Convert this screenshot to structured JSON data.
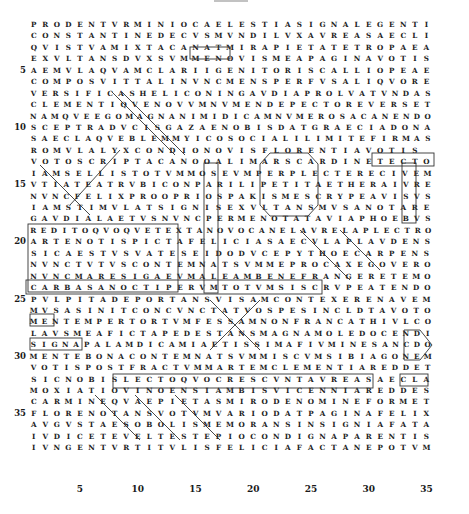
{
  "page": {
    "type": "carmen cancellatum (Latin grid poem)"
  },
  "grid": {
    "rows": [
      "PRODENTVRMINIOCAELESTIASIGNALEGENTI",
      "CONSTANTINEDECVSMVNDILVXAVREASAECLI",
      "QVISTVAMIXTACANATMIRAPIETATETROPAEA",
      "EXVLTANSDVXSVMMENOVISMEAPAGINAVOTIS",
      "AEMVLAQVAMCLARIIGENITORISCALLIOPEAE",
      "COMPOSVITTALINVNCMENSPERFVSALIQVORE",
      "VERSIFICASHELICONINGAVDIAPROLVATVNDAS",
      "CLEMENTIQVENOVVMNVMENDEPECTOREVERSET",
      "NAMQVEEGOMAGNANIMIDICAMNVMEROSACANENDO",
      "SCEPTRADVCISGAZAENOBISDATGRAECIADONA",
      "SAECLAQVEBLEMMYICOSOCIALILIMITEFIRMAS",
      "ROMVLALYXCONDIONOVISFLORENTIAVOTIS",
      "VOTOSCRIPTACANOOALIMARSCARDINETECTO",
      "IAMSELLISTOTVMMOSEVMPERPLECTERECIVEM",
      "VTIATEATRVBICONPARILIPETITAETHERAIVRE",
      "NVNCFELIXPROOPRIOSPAKISMESCRYPEAVISVS",
      "IAMSTIMVLATSIGNISEXVLTANSMVSANOTARE",
      "GAVDIALAETVSNVNCPERMENOTATAVIAPHOEBVS",
      "REDITOQVOQVETEXTANOVOCANELAVRELAPLECTRO",
      "ARTENOTISPICTAFELICIASAECVLAPLAVDENS",
      "SICAESTVSVATESEIDODVCEPYTHOECARPENS",
      "NVNCTVTVSCONTEMNATSVMMEPROCAXEGOVERO",
      "NVNCMARESIGAEVMALEAMBENEFRANGERETEMO",
      "CARBASANOCTIPERVMTOTVMSISCRVPEATENDO",
      "PVLPITADEPORTANSVISAMCONTEXERENAVEM",
      "MVSASINITCONCVNCTATVOSPESINCLDTAVOTO",
      "MENTEMPERTORTVMFESSAMNONFRANCATHIVLCO",
      "LAVSMEAFICTAPEDESTANSMAGNAMOLEDOCENDI",
      "SIGNAPALAMDICAMIAETISSIMAFIVMINESANCDO",
      "MENTEBONACONTEMNATSVMMISCVMSIBIAGONEM",
      "VOTISPOSTFRACTVMMARTEMCLEMENTIAREDDET",
      "SICNOBISLECTOQVOCRESCVNTAVREASAECLA",
      "MOXIATIOVINOENSIAMBISVICENNIAREDDES",
      "CARMINEQVAEPIETASMIRODENOMINEFORMET",
      "FLORENOTANSVOTVMVARIODATPAGINAFELIX",
      "AVGVSTAESOBOLISMEMORANSINSIGNIAFATA",
      "IVDICETEVELTESTEPIOCONDIGNAPARENTIS",
      "IVNGENTVRTITVLISFELICIAFACTANEPOTVM"
    ],
    "row_numbers": {
      "4": "5",
      "9": "10",
      "14": "15",
      "19": "20",
      "24": "25",
      "29": "30",
      "34": "35"
    },
    "highlighted_words": [
      "MENO",
      "IGENI",
      "NCME",
      "ONI",
      "FLO",
      "VOTIS",
      "SCAR",
      "ERPLE",
      "PETIT",
      "MES",
      "MENO",
      "NVNCTVTVSCONTEMNATSVMMEPROC",
      "PVL",
      "SA",
      "MENTEM",
      "LA",
      "NACONTEMNATSVMMISCVM",
      "NEM",
      "NVNC",
      "IA",
      "GA",
      "RE",
      "AR",
      "SI"
    ]
  },
  "axis": {
    "ticks": [
      "5",
      "10",
      "15",
      "20",
      "25",
      "30",
      "35"
    ]
  }
}
